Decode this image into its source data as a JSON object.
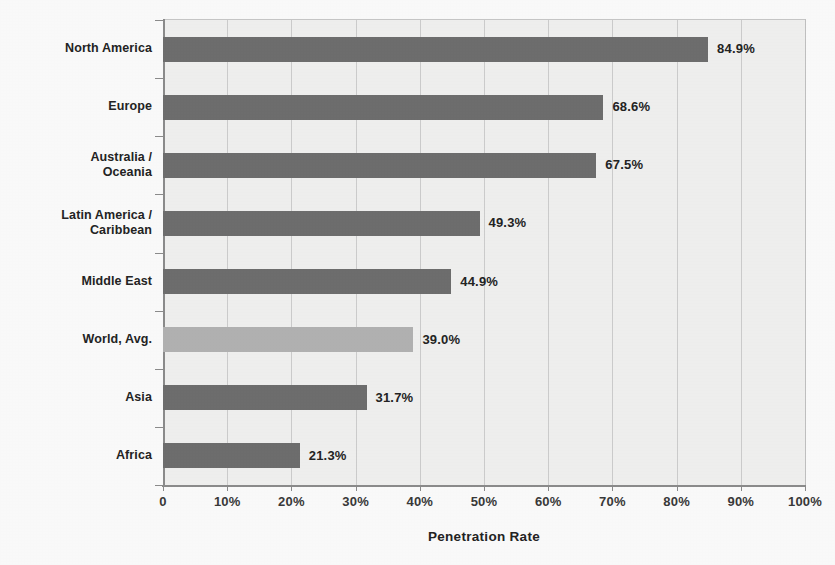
{
  "chart_data": {
    "type": "bar",
    "orientation": "horizontal",
    "title": "",
    "xlabel": "Penetration Rate",
    "ylabel": "",
    "xlim": [
      0,
      100
    ],
    "grid": true,
    "legend": false,
    "categories": [
      "North America",
      "Europe",
      "Australia /\nOceania",
      "Latin America /\nCaribbean",
      "Middle East",
      "World, Avg.",
      "Asia",
      "Africa"
    ],
    "values": [
      84.9,
      68.6,
      67.5,
      49.3,
      44.9,
      39.0,
      31.7,
      21.3
    ],
    "data_labels": [
      "84.9%",
      "68.6%",
      "67.5%",
      "49.3%",
      "44.9%",
      "39.0%",
      "31.7%",
      "21.3%"
    ],
    "xticks": [
      0,
      10,
      20,
      30,
      40,
      50,
      60,
      70,
      80,
      90,
      100
    ],
    "xticklabels": [
      "0",
      "10%",
      "20%",
      "30%",
      "40%",
      "50%",
      "60%",
      "70%",
      "80%",
      "90%",
      "100%"
    ],
    "series": [
      {
        "name": "Penetration Rate",
        "values": [
          84.9,
          68.6,
          67.5,
          49.3,
          44.9,
          39.0,
          31.7,
          21.3
        ]
      }
    ],
    "bar_colors": [
      "#6f6f6f",
      "#6f6f6f",
      "#6f6f6f",
      "#6f6f6f",
      "#6f6f6f",
      "#b4b4b4",
      "#6f6f6f",
      "#6f6f6f"
    ],
    "highlight_category": "World, Avg.",
    "colors": {
      "bar_dark": "#6f6f6f",
      "bar_light": "#b4b4b4",
      "plot_background": "#f3f3f2",
      "gridline": "#cfcfcf",
      "axis": "#8d8d8d",
      "text": "#242424"
    }
  },
  "categories_display": [
    {
      "line1": "North America",
      "line2": ""
    },
    {
      "line1": "Europe",
      "line2": ""
    },
    {
      "line1": "Australia /",
      "line2": "Oceania"
    },
    {
      "line1": "Latin America /",
      "line2": "Caribbean"
    },
    {
      "line1": "Middle East",
      "line2": ""
    },
    {
      "line1": "World, Avg.",
      "line2": ""
    },
    {
      "line1": "Asia",
      "line2": ""
    },
    {
      "line1": "Africa",
      "line2": ""
    }
  ]
}
